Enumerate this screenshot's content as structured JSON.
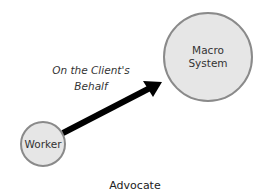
{
  "diagram": {
    "caption": "Advocate",
    "nodes": [
      {
        "id": "worker",
        "label": "Worker",
        "cx": 43,
        "cy": 144,
        "r": 22
      },
      {
        "id": "macro-system",
        "label_line1": "Macro",
        "label_line2": "System",
        "cx": 208,
        "cy": 57,
        "r": 44
      }
    ],
    "edge": {
      "from": "worker",
      "to": "macro-system",
      "label_line1": "On the Client's",
      "label_line2": "Behalf"
    },
    "colors": {
      "node_fill": "#e6e6e6",
      "node_stroke": "#8a8a8a",
      "arrow": "#000000",
      "text": "#333333"
    }
  }
}
